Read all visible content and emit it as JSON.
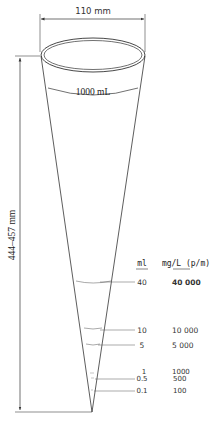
{
  "diagram": {
    "width_dimension": "110 mm",
    "height_dimension": "444–457 mm",
    "capacity_label": "1000 mL",
    "columns": {
      "ml_header": "ml",
      "conc_header": "mg/L (p/m)"
    },
    "graduations": [
      {
        "ml": "40",
        "conc": "40 000"
      },
      {
        "ml": "10",
        "conc": "10 000"
      },
      {
        "ml": "5",
        "conc": "5 000"
      },
      {
        "ml": "1",
        "conc": "1000"
      },
      {
        "ml": "0.5",
        "conc": "500"
      },
      {
        "ml": "0.1",
        "conc": "100"
      }
    ],
    "colors": {
      "line": "#333333",
      "background": "#ffffff"
    }
  }
}
